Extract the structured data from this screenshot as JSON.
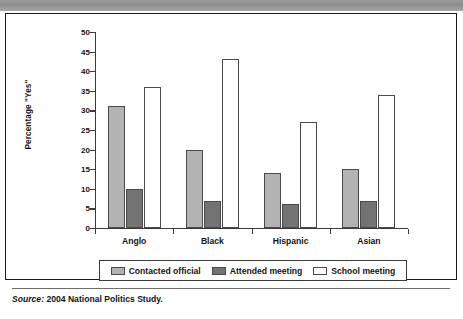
{
  "figure": {
    "source_prefix": "Source:",
    "source_text": "2004 National Politics Study."
  },
  "colors": {
    "contacted_official": "#b3b3b3",
    "attended_meeting": "#737373",
    "school_meeting": "#ffffff",
    "bar_outline": "#4a4a4a",
    "axis": "#3b3b3b",
    "text": "#141414",
    "frame": "#1a1a1a",
    "top_bar": "#9b9b9b"
  },
  "chart_data": {
    "type": "bar",
    "title": "",
    "xlabel": "",
    "ylabel": "Percentage \"Yes\"",
    "ylim": [
      0,
      50
    ],
    "ytick_step": 5,
    "yticks": [
      0,
      5,
      10,
      15,
      20,
      25,
      30,
      35,
      40,
      45,
      50
    ],
    "ytick_labels": [
      "0",
      "5",
      "10",
      "15",
      "20",
      "25",
      "30",
      "35",
      "40",
      "45",
      "50"
    ],
    "grid": false,
    "legend_position": "bottom",
    "categories": [
      "Anglo",
      "Black",
      "Hispanic",
      "Asian"
    ],
    "series": [
      {
        "name": "Contacted official",
        "color": "#b3b3b3",
        "values": [
          31,
          20,
          14,
          15
        ]
      },
      {
        "name": "Attended meeting",
        "color": "#737373",
        "values": [
          10,
          7,
          6,
          7
        ]
      },
      {
        "name": "School meeting",
        "color": "#ffffff",
        "values": [
          36,
          43,
          27,
          34
        ]
      }
    ]
  }
}
